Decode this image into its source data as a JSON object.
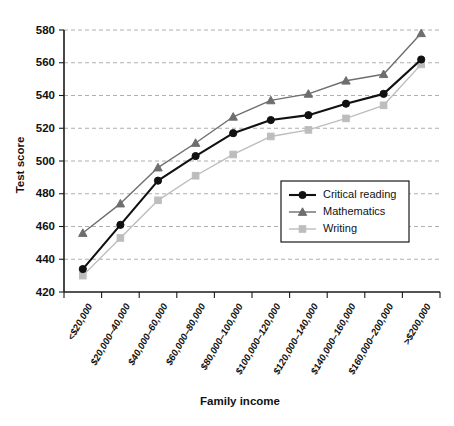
{
  "chart_data": {
    "type": "line",
    "title": "",
    "xlabel": "Family income",
    "ylabel": "Test score",
    "ylim": [
      420,
      580
    ],
    "yticks": [
      420,
      440,
      460,
      480,
      500,
      520,
      540,
      560,
      580
    ],
    "grid": true,
    "legend_position": "center-right",
    "categories": [
      "<$20,000",
      "$20,000–40,000",
      "$40,000–60,000",
      "$60,000–80,000",
      "$80,000–100,000",
      "$100,000–120,000",
      "$120,000–140,000",
      "$140,000–160,000",
      "$160,000–200,000",
      ">$200,000"
    ],
    "series": [
      {
        "name": "Critical reading",
        "marker": "circle",
        "color": "#111111",
        "values": [
          434,
          461,
          488,
          503,
          517,
          525,
          528,
          535,
          541,
          562
        ]
      },
      {
        "name": "Mathematics",
        "marker": "triangle",
        "color": "#6e6e6e",
        "values": [
          456,
          474,
          496,
          511,
          527,
          537,
          541,
          549,
          553,
          578
        ]
      },
      {
        "name": "Writing",
        "marker": "square",
        "color": "#bdbdbd",
        "values": [
          430,
          453,
          476,
          491,
          504,
          515,
          519,
          526,
          534,
          559
        ]
      }
    ]
  },
  "legend": {
    "entries": [
      {
        "label": "Critical reading"
      },
      {
        "label": "Mathematics"
      },
      {
        "label": "Writing"
      }
    ]
  }
}
